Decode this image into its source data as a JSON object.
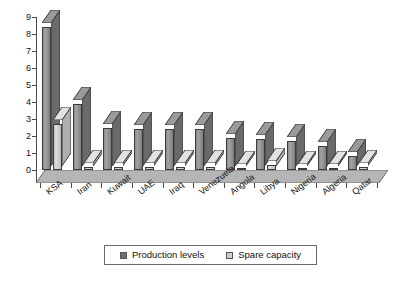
{
  "chart_data": {
    "type": "bar",
    "title": "",
    "subtitle": "",
    "xlabel": "",
    "ylabel": "",
    "ylim": [
      0,
      9
    ],
    "yticks": [
      0,
      1,
      2,
      3,
      4,
      5,
      6,
      7,
      8,
      9
    ],
    "grid": false,
    "legend_position": "bottom",
    "categories": [
      "KSA",
      "Iran",
      "Kuwait",
      "UAE",
      "Iraq",
      "Venezuela",
      "Angola",
      "Libya",
      "Nigeria",
      "Algeria",
      "Qatar"
    ],
    "series": [
      {
        "name": "Production levels",
        "color": "#8e8e8e",
        "values": [
          8.4,
          3.9,
          2.5,
          2.4,
          2.4,
          2.4,
          1.9,
          1.8,
          1.7,
          1.4,
          0.8
        ]
      },
      {
        "name": "Spare capacity",
        "color": "#cfcfcf",
        "values": [
          2.7,
          0.2,
          0.15,
          0.15,
          0.15,
          0.15,
          0.1,
          0.3,
          0.1,
          0.1,
          0.15
        ]
      }
    ]
  },
  "legend": {
    "items": [
      {
        "label": "Production levels",
        "swatch": "production"
      },
      {
        "label": "Spare capacity",
        "swatch": "spare"
      }
    ]
  }
}
